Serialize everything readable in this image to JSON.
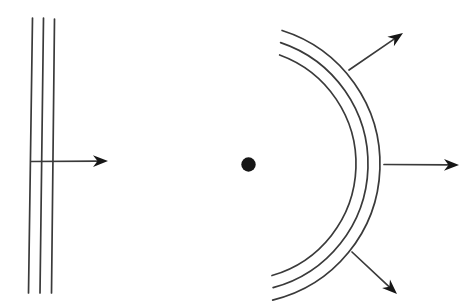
{
  "figure": {
    "background_color": "#ffffff",
    "stroke_color": "#3a3a3a",
    "ink_color": "#161616",
    "line_width": 1.7,
    "canvas": {
      "width": 471,
      "height": 308
    }
  },
  "plane_wave": {
    "wavefront_lines": [
      {
        "x1": 32.5,
        "y1": 18,
        "x2": 28.5,
        "y2": 293
      },
      {
        "x1": 43.5,
        "y1": 18,
        "x2": 40.0,
        "y2": 293
      },
      {
        "x1": 54.5,
        "y1": 19,
        "x2": 51.5,
        "y2": 293
      }
    ],
    "ray": {
      "x1": 31,
      "y1": 161.5,
      "x2": 108,
      "y2": 161
    }
  },
  "spherical_wave": {
    "source_dot": {
      "cx": 248.5,
      "cy": 164.5,
      "r": 7.2
    },
    "arc_center": {
      "cx": 240,
      "cy": 164
    },
    "wavefront_arcs": [
      {
        "r": 116,
        "start_deg": -70.0,
        "end_deg": 74.0
      },
      {
        "r": 128,
        "start_deg": -71.5,
        "end_deg": 75.0
      },
      {
        "r": 140,
        "start_deg": -72.5,
        "end_deg": 76.5
      }
    ],
    "rays": [
      {
        "x1": 349,
        "y1": 70,
        "x2": 403,
        "y2": 33
      },
      {
        "x1": 384,
        "y1": 164.5,
        "x2": 459,
        "y2": 165
      },
      {
        "x1": 352,
        "y1": 252,
        "x2": 397,
        "y2": 294
      }
    ]
  },
  "arrowhead_style": {
    "length": 15,
    "half_width": 5.8,
    "notch": 10.5
  }
}
